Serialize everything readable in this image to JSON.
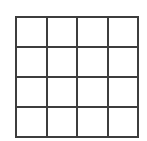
{
  "grid": {
    "rows": 4,
    "columns": 4,
    "line_color": "#3d3d3d",
    "cell_fill": "#ffffff",
    "cells": [
      [
        "",
        "",
        "",
        ""
      ],
      [
        "",
        "",
        "",
        ""
      ],
      [
        "",
        "",
        "",
        ""
      ],
      [
        "",
        "",
        "",
        ""
      ]
    ]
  }
}
